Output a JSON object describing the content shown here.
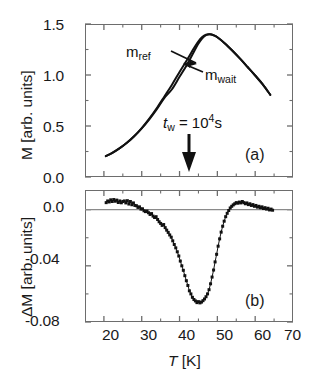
{
  "figure": {
    "background": "#ffffff",
    "axis_color": "#6d6d6d",
    "curve_color": "#111111",
    "marker_color": "#111111"
  },
  "panel_a": {
    "tag": "(a)",
    "ylabel": "M [arb. units]",
    "yticks": [
      "0.0",
      "0.5",
      "1.0",
      "1.5"
    ],
    "ytick_values": [
      0.0,
      0.5,
      1.0,
      1.5
    ],
    "ylim": [
      0.0,
      1.5
    ],
    "annotations": {
      "m_ref": "m",
      "m_ref_sub": "ref",
      "m_wait": "m",
      "m_wait_sub": "wait",
      "tw_label": "t",
      "tw_sub": "w",
      "tw_eq": " = 10",
      "tw_exp": "4",
      "tw_unit": "s"
    }
  },
  "panel_b": {
    "tag": "(b)",
    "ylabel": "ΔM [arb. units]",
    "yticks": [
      "0.0",
      "-0.04",
      "-0.08"
    ],
    "ytick_values": [
      0.0,
      -0.04,
      -0.08
    ],
    "ylim": [
      -0.08,
      0.014
    ]
  },
  "xaxis": {
    "title_italic": "T",
    "title_rest": " [K]",
    "ticks": [
      "20",
      "30",
      "40",
      "50",
      "60",
      "70"
    ],
    "tick_values": [
      20,
      30,
      40,
      50,
      60,
      70
    ],
    "minor_tick_values": [
      15,
      25,
      35,
      45,
      55,
      65
    ],
    "xlim": [
      15,
      70
    ]
  },
  "chart_data": [
    {
      "type": "line",
      "panel": "(a)",
      "title": "",
      "xlabel": "T [K]",
      "ylabel": "M [arb. units]",
      "xlim": [
        15,
        70
      ],
      "ylim": [
        0.0,
        1.5
      ],
      "grid": false,
      "legend": [
        "m_ref",
        "m_wait"
      ],
      "legend_position": "inline-annotation",
      "annotation": "t_w = 10^4 s",
      "annotation_x": 42,
      "x": [
        20.5,
        22,
        24,
        26,
        28,
        30,
        32,
        34,
        36,
        38,
        40,
        42,
        44,
        45,
        46,
        47,
        48,
        49,
        50,
        52,
        54,
        56,
        58,
        60,
        62,
        64
      ],
      "series": [
        {
          "name": "m_ref",
          "values": [
            0.205,
            0.232,
            0.278,
            0.333,
            0.4,
            0.48,
            0.572,
            0.676,
            0.79,
            0.905,
            1.03,
            1.15,
            1.275,
            1.33,
            1.372,
            1.396,
            1.4,
            1.39,
            1.37,
            1.31,
            1.238,
            1.16,
            1.078,
            0.995,
            0.908,
            0.805
          ]
        },
        {
          "name": "m_wait",
          "values": [
            0.205,
            0.232,
            0.278,
            0.333,
            0.399,
            0.477,
            0.566,
            0.666,
            0.776,
            0.86,
            0.982,
            1.104,
            1.243,
            1.308,
            1.36,
            1.39,
            1.399,
            1.39,
            1.37,
            1.31,
            1.238,
            1.16,
            1.078,
            0.995,
            0.908,
            0.805
          ]
        }
      ]
    },
    {
      "type": "scatter",
      "panel": "(b)",
      "title": "",
      "xlabel": "T [K]",
      "ylabel": "ΔM [arb. units]",
      "xlim": [
        15,
        70
      ],
      "ylim": [
        -0.08,
        0.014
      ],
      "grid": false,
      "zero_line": 0.0,
      "series_name": "ΔM = m_wait - m_ref",
      "x": [
        20.6,
        21.0,
        21.4,
        21.8,
        22.2,
        22.6,
        23.0,
        23.4,
        23.8,
        24.2,
        24.6,
        25.0,
        25.4,
        25.8,
        26.2,
        26.6,
        27.0,
        27.4,
        27.8,
        28.2,
        28.6,
        29.0,
        29.4,
        29.8,
        30.2,
        30.6,
        31.0,
        31.4,
        31.8,
        32.2,
        32.6,
        33.0,
        33.4,
        33.8,
        34.2,
        34.6,
        35.0,
        35.4,
        35.8,
        36.2,
        36.6,
        37.0,
        37.4,
        37.8,
        38.2,
        38.6,
        39.0,
        39.4,
        39.8,
        40.2,
        40.6,
        41.0,
        41.4,
        41.8,
        42.2,
        42.6,
        43.0,
        43.4,
        43.8,
        44.2,
        44.6,
        45.0,
        45.4,
        45.8,
        46.2,
        46.6,
        47.0,
        47.4,
        47.8,
        48.2,
        48.6,
        49.0,
        49.4,
        49.8,
        50.2,
        50.6,
        51.0,
        51.4,
        51.8,
        52.2,
        52.6,
        53.0,
        53.4,
        53.8,
        54.2,
        54.6,
        55.0,
        55.4,
        55.8,
        56.2,
        56.6,
        57.0,
        57.4,
        57.8,
        58.2,
        58.6,
        59.0,
        59.4,
        59.8,
        60.2,
        60.6,
        61.0,
        61.4,
        61.8,
        62.2,
        62.6,
        63.0,
        63.4,
        63.8,
        64.2,
        64.6
      ],
      "y": [
        0.005,
        0.0062,
        0.0055,
        0.007,
        0.0058,
        0.0072,
        0.006,
        0.0068,
        0.0051,
        0.0062,
        0.0049,
        0.0058,
        0.0062,
        0.0048,
        0.0064,
        0.004,
        0.0058,
        0.0035,
        0.0048,
        0.003,
        0.0028,
        0.0016,
        0.002,
        0.0004,
        0.0006,
        -0.0008,
        -0.0014,
        -0.001,
        -0.0022,
        -0.0034,
        -0.0028,
        -0.0046,
        -0.0056,
        -0.005,
        -0.007,
        -0.0086,
        -0.0098,
        -0.0112,
        -0.0106,
        -0.0128,
        -0.0146,
        -0.0162,
        -0.018,
        -0.0196,
        -0.0222,
        -0.0248,
        -0.0272,
        -0.03,
        -0.033,
        -0.0366,
        -0.04,
        -0.0432,
        -0.047,
        -0.0506,
        -0.054,
        -0.0578,
        -0.06,
        -0.0624,
        -0.064,
        -0.065,
        -0.0662,
        -0.0655,
        -0.0664,
        -0.0658,
        -0.0648,
        -0.0636,
        -0.062,
        -0.06,
        -0.057,
        -0.0528,
        -0.048,
        -0.043,
        -0.0372,
        -0.0318,
        -0.026,
        -0.0208,
        -0.016,
        -0.0118,
        -0.0082,
        -0.005,
        -0.0026,
        -0.0006,
        0.0012,
        0.0024,
        0.0034,
        0.0042,
        0.005,
        0.0046,
        0.0054,
        0.0048,
        0.0058,
        0.005,
        0.0042,
        0.0048,
        0.0036,
        0.0042,
        0.003,
        0.0036,
        0.0024,
        0.003,
        0.0018,
        0.0024,
        0.0014,
        0.002,
        0.0008,
        0.0014,
        0.0004,
        0.001,
        -0.0002,
        0.0004,
        -0.0004
      ],
      "minimum": {
        "x": 42.2,
        "y": -0.066
      },
      "n_points": 111
    }
  ]
}
